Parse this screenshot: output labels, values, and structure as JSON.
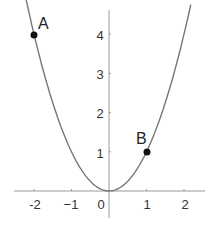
{
  "chart_data": {
    "type": "line",
    "title": "",
    "xlabel": "",
    "ylabel": "",
    "function": "y = x^2",
    "xlim": [
      -2.6,
      2.5
    ],
    "ylim": [
      -0.6,
      4.9
    ],
    "grid": false,
    "x_ticks": [
      -2,
      -1,
      0,
      1,
      2
    ],
    "x_tick_labels": [
      "-2",
      "−1",
      "0",
      "1",
      "2"
    ],
    "y_ticks": [
      1,
      2,
      3,
      4
    ],
    "y_tick_labels": [
      "1",
      "2",
      "3",
      "4"
    ],
    "series": [
      {
        "name": "parabola",
        "color": "#777777",
        "x_range": [
          -2.25,
          2.18
        ]
      }
    ],
    "points": [
      {
        "label": "A",
        "x": -2,
        "y": 4
      },
      {
        "label": "B",
        "x": 1,
        "y": 1
      }
    ]
  },
  "labels": {
    "xt": [
      "-2",
      "−1",
      "0",
      "1",
      "2"
    ],
    "yt": [
      "1",
      "2",
      "3",
      "4"
    ],
    "A": "A",
    "B": "B"
  }
}
